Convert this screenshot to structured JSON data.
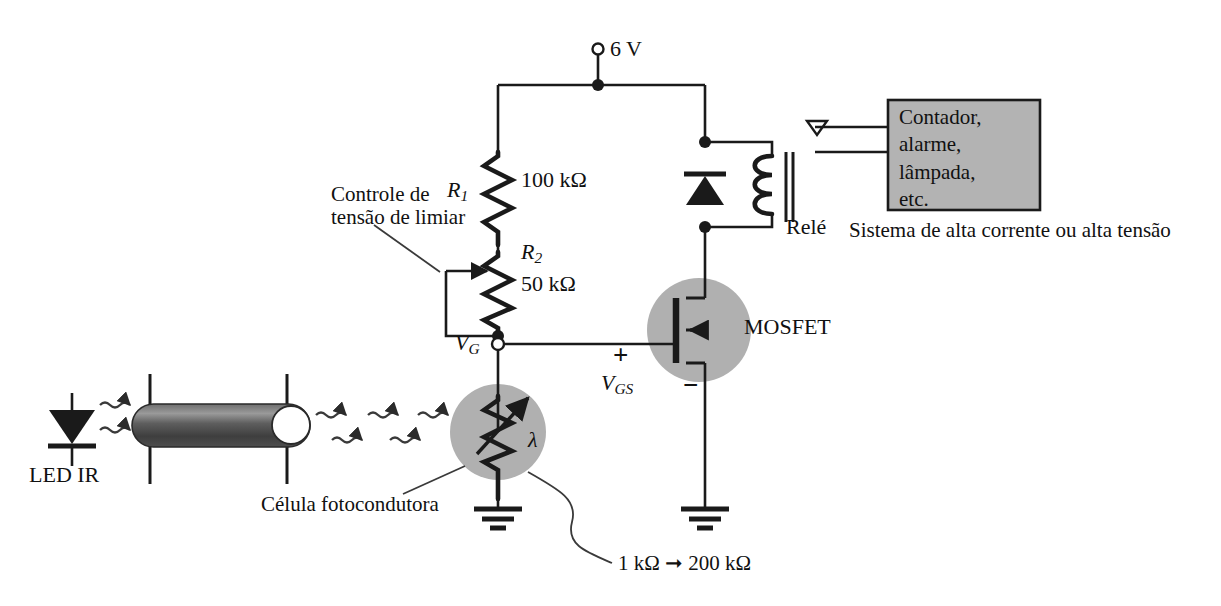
{
  "figure": {
    "language": "pt-BR"
  },
  "supply": {
    "label": "6 V",
    "terminal_icon": "open-terminal-circle"
  },
  "resistors": {
    "r1": {
      "designator": "R",
      "subscript": "1",
      "value": "100 kΩ"
    },
    "r2": {
      "designator": "R",
      "subscript": "2",
      "value": "50 kΩ"
    }
  },
  "annotations": {
    "threshold_control": "Controle de\ntensão de limiar",
    "threshold_control_line1": "Controle de",
    "threshold_control_line2": "tensão de limiar",
    "photocell_caption": "Célula fotocondutora",
    "resistance_range": "1 kΩ ➞ 200 kΩ",
    "resistance_min": "1 kΩ",
    "resistance_max": "200 kΩ",
    "range_arrow": "arrow-right-icon",
    "high_power_caption": "Sistema de alta corrente ou alta tensão"
  },
  "nodes": {
    "gate": {
      "designator": "V",
      "subscript": "G",
      "icon": "open-node-circle"
    },
    "vgs": {
      "designator": "V",
      "subscript": "GS",
      "plus": "+",
      "minus": "−"
    }
  },
  "devices": {
    "mosfet": {
      "label": "MOSFET",
      "type": "n-channel-enhancement"
    },
    "relay": {
      "label": "Relé",
      "coil_turns": 3
    },
    "diode": {
      "name": "flyback-diode",
      "orientation": "up"
    },
    "led": {
      "label": "LED IR",
      "name": "infrared-led"
    },
    "photocell": {
      "wavelength_symbol": "λ",
      "name": "photoconductive-cell"
    },
    "light_pipe": {
      "name": "light-guide-tube"
    },
    "ground": {
      "name": "ground-symbol",
      "count": 3
    }
  },
  "load_block": {
    "lines": [
      "Contador,",
      "alarme,",
      "lâmpada,",
      "etc."
    ],
    "text": "Contador,\nalarme,\nlâmpada,\netc.",
    "fill_color": "#b3b3b3",
    "border_color": "#1a1a1a"
  },
  "colors": {
    "wire": "#1a1a1a",
    "text": "#111111",
    "highlight_circle": "#b0b0b0",
    "tube_dark": "#4a4a4a",
    "tube_light": "#8a8a8a",
    "box_fill": "#b3b3b3",
    "paper": "#ffffff"
  }
}
